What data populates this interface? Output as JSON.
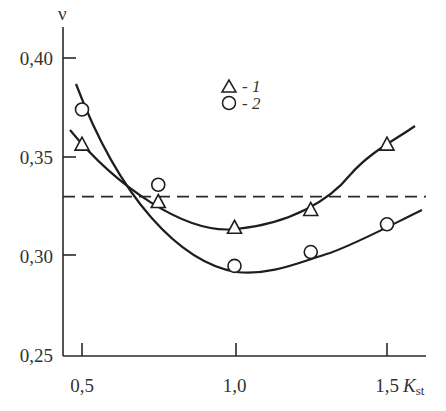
{
  "chart_data": {
    "type": "line",
    "title": "",
    "xlabel": "K",
    "xlabel_sub": "st",
    "ylabel": "ν",
    "xlim": [
      0.45,
      1.63
    ],
    "ylim": [
      0.25,
      0.4
    ],
    "x_ticks": [
      0.5,
      1.0,
      1.5
    ],
    "x_tick_labels": [
      "0,5",
      "1,0",
      "1,5"
    ],
    "y_ticks": [
      0.25,
      0.3,
      0.35,
      0.4
    ],
    "y_tick_labels": [
      "0,25",
      "0,30",
      "0,35",
      "0,40"
    ],
    "grid": false,
    "legend_position": "upper center",
    "series": [
      {
        "name": "1",
        "marker": "triangle",
        "x": [
          0.5,
          0.75,
          1.0,
          1.25,
          1.5
        ],
        "values": [
          0.356,
          0.327,
          0.314,
          0.323,
          0.356
        ]
      },
      {
        "name": "2",
        "marker": "circle",
        "x": [
          0.5,
          0.75,
          1.0,
          1.25,
          1.5
        ],
        "values": [
          0.374,
          0.336,
          0.295,
          0.302,
          0.316
        ]
      }
    ],
    "reference_line": {
      "style": "dashed",
      "y": 0.33
    },
    "legend": [
      {
        "marker": "triangle",
        "label": "- 1"
      },
      {
        "marker": "circle",
        "label": "- 2"
      }
    ]
  }
}
